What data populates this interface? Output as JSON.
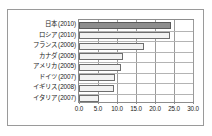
{
  "figure": {
    "name": "horizontal-bar-chart",
    "frame_border_color": "#9a9a9a",
    "background_color": "#ffffff"
  },
  "chart_data": {
    "type": "bar",
    "orientation": "horizontal",
    "title": "",
    "subtitle": "",
    "xlabel": "",
    "ylabel": "",
    "categories": [
      "日本 (2010)",
      "ロシア (2010)",
      "フランス (2006)",
      "カナダ (2005)",
      "アメリカ (2005)",
      "ドイツ (2007)",
      "イギリス (2008)",
      "イタリア (2007)"
    ],
    "values": [
      24.1,
      23.9,
      17.2,
      11.7,
      11.0,
      9.5,
      9.3,
      5.2
    ],
    "xlim": [
      0.0,
      30.0
    ],
    "xticks": [
      0.0,
      5.0,
      10.0,
      15.0,
      20.0,
      25.0,
      30.0
    ],
    "xtick_labels": [
      "0.0",
      "5.0",
      "10.0",
      "15.0",
      "20.0",
      "25.0",
      "30.0"
    ],
    "grid": true,
    "grid_axis": "x",
    "legend": null,
    "bar_fill_color": "#f2f2f2",
    "bar_edge_color": "#6e6e6e",
    "highlight_index": 0,
    "highlight_fill_color": "#8e8e8e",
    "highlight_edge_color": "#5a5a5a"
  }
}
